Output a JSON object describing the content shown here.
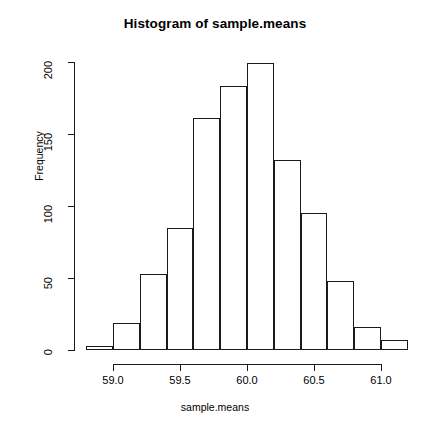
{
  "chart_data": {
    "type": "bar",
    "title": "Histogram of sample.means",
    "xlabel": "sample.means",
    "ylabel": "Frequency",
    "bin_width": 0.2,
    "bin_edges": [
      58.8,
      59.0,
      59.2,
      59.4,
      59.6,
      59.8,
      60.0,
      60.2,
      60.4,
      60.6,
      60.8,
      61.0,
      61.2
    ],
    "categories": [
      "58.8-59.0",
      "59.0-59.2",
      "59.2-59.4",
      "59.4-59.6",
      "59.6-59.8",
      "59.8-60.0",
      "60.0-60.2",
      "60.2-60.4",
      "60.4-60.6",
      "60.6-60.8",
      "60.8-61.0",
      "61.0-61.2"
    ],
    "values": [
      3,
      19,
      53,
      85,
      161,
      183,
      199,
      132,
      95,
      48,
      16,
      7
    ],
    "xlim": [
      58.8,
      61.2
    ],
    "ylim": [
      0,
      200
    ],
    "xticks": [
      59.0,
      59.5,
      60.0,
      60.5,
      61.0
    ],
    "xtick_labels": [
      "59.0",
      "59.5",
      "60.0",
      "60.5",
      "61.0"
    ],
    "yticks": [
      0,
      50,
      100,
      150,
      200
    ],
    "ytick_labels": [
      "0",
      "50",
      "100",
      "150",
      "200"
    ],
    "grid": false,
    "legend": null,
    "bar_fill": "#ffffff",
    "bar_stroke": "#1a1a1a",
    "axis_color": "#1a1a1a"
  }
}
